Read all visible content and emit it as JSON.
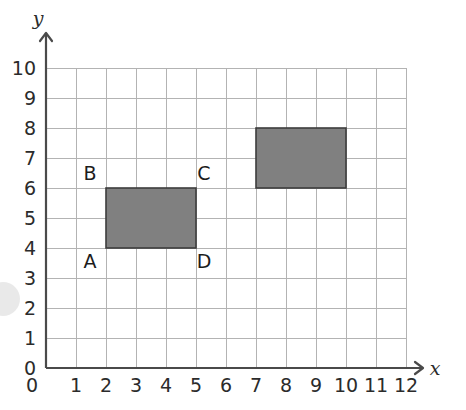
{
  "figure": {
    "title": "",
    "axis_labels": {
      "x": "x",
      "y": "y"
    },
    "grid_color": "#b3b3b3",
    "axis_color": "#4a4a4a",
    "shape_fill": "#808080",
    "shape_stroke": "#3c3c3c"
  },
  "chart_data": {
    "type": "scatter",
    "title": "",
    "xlabel": "x",
    "ylabel": "y",
    "xlim": [
      0,
      12
    ],
    "ylim": [
      0,
      10
    ],
    "grid": true,
    "legend": "none",
    "x_ticks": [
      "0",
      "1",
      "2",
      "3",
      "4",
      "5",
      "6",
      "7",
      "8",
      "9",
      "10",
      "11",
      "12"
    ],
    "y_ticks": [
      "0",
      "1",
      "2",
      "3",
      "4",
      "5",
      "6",
      "7",
      "8",
      "9",
      "10"
    ],
    "shapes": [
      {
        "name": "rectangle-ABCD",
        "kind": "rectangle",
        "fill": "#808080",
        "x_range": [
          2,
          5
        ],
        "y_range": [
          4,
          6
        ],
        "width_units": 3,
        "height_units": 2,
        "vertices": [
          {
            "label": "A",
            "x": 2,
            "y": 4
          },
          {
            "label": "B",
            "x": 2,
            "y": 6
          },
          {
            "label": "C",
            "x": 5,
            "y": 6
          },
          {
            "label": "D",
            "x": 5,
            "y": 4
          }
        ]
      },
      {
        "name": "rectangle-unlabeled",
        "kind": "rectangle",
        "fill": "#808080",
        "x_range": [
          7,
          10
        ],
        "y_range": [
          6,
          8
        ],
        "width_units": 3,
        "height_units": 2,
        "vertices": []
      }
    ],
    "point_labels": [
      {
        "text": "A",
        "x": 2,
        "y": 4,
        "anchor": "below-left"
      },
      {
        "text": "B",
        "x": 2,
        "y": 6,
        "anchor": "above-left"
      },
      {
        "text": "C",
        "x": 5,
        "y": 6,
        "anchor": "above-right"
      },
      {
        "text": "D",
        "x": 5,
        "y": 4,
        "anchor": "below-right"
      }
    ]
  }
}
